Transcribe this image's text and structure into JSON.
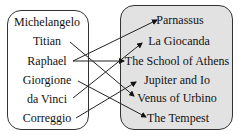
{
  "diagram": {
    "type": "mapping",
    "left_set": {
      "name": "painters",
      "items": [
        "Michelangelo",
        "Titian",
        "Raphael",
        "Giorgione",
        "da Vinci",
        "Correggio"
      ]
    },
    "right_set": {
      "name": "paintings",
      "items": [
        "Parnassus",
        "La Giocanda",
        "The School of Athens",
        "Jupiter and Io",
        "Venus of Urbino",
        "The Tempest"
      ]
    },
    "mappings": [
      {
        "from": "Raphael",
        "to": "Parnassus"
      },
      {
        "from": "Raphael",
        "to": "The School of Athens"
      },
      {
        "from": "Titian",
        "to": "Venus of Urbino"
      },
      {
        "from": "Giorgione",
        "to": "The Tempest"
      },
      {
        "from": "da Vinci",
        "to": "La Giocanda"
      },
      {
        "from": "Correggio",
        "to": "Jupiter and Io"
      }
    ],
    "colors": {
      "left_fill": "#ffffff",
      "right_fill": "#e2e2e2",
      "stroke": "#333333",
      "text": "#111111"
    }
  }
}
